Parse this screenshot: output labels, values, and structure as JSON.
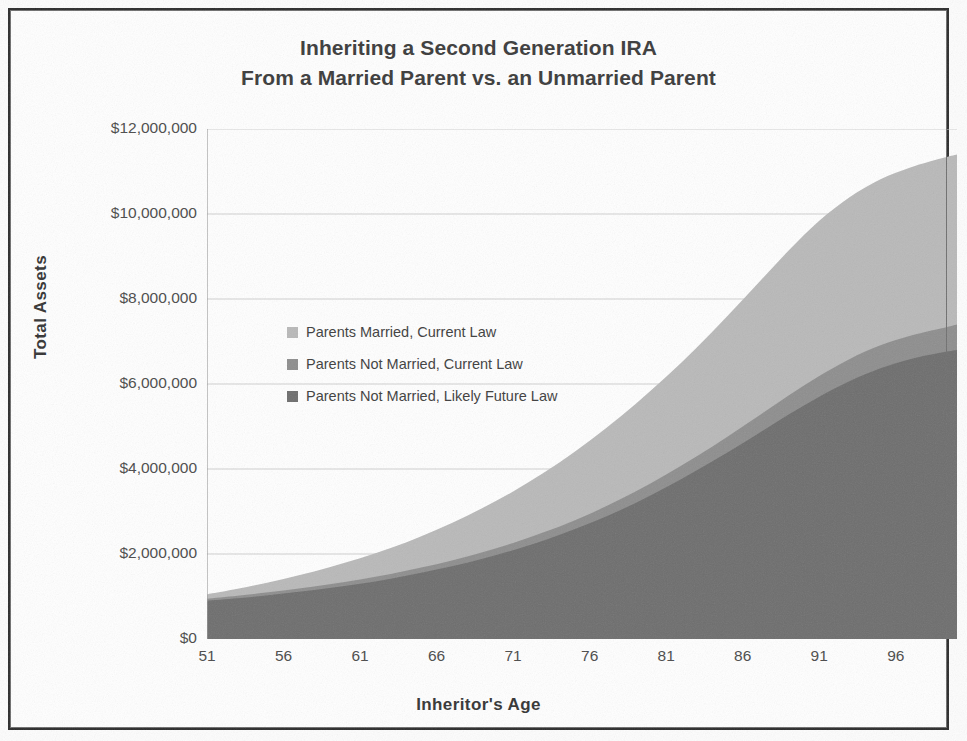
{
  "chart_data": {
    "type": "area",
    "stacked": false,
    "title": "Inheriting a Second Generation IRA",
    "subtitle": "From a Married Parent vs. an Unmarried Parent",
    "title_lines": [
      "Inheriting a Second Generation IRA",
      "From a Married Parent vs. an Unmarried Parent"
    ],
    "xlabel": "Inheritor's Age",
    "ylabel": "Total Assets",
    "xlim": [
      51,
      100
    ],
    "ylim": [
      0,
      12000000
    ],
    "ytick_step": 2000000,
    "xtick_step": 5,
    "xtick_minor_step": 1,
    "grid": "horizontal",
    "legend_position": "inside-left",
    "ytick_labels": [
      "$12,000,000",
      "$10,000,000",
      "$8,000,000",
      "$6,000,000",
      "$4,000,000",
      "$2,000,000",
      "$0"
    ],
    "ytick_values": [
      12000000,
      10000000,
      8000000,
      6000000,
      4000000,
      2000000,
      0
    ],
    "xtick_labels": [
      "51",
      "56",
      "61",
      "66",
      "71",
      "76",
      "81",
      "86",
      "91",
      "96"
    ],
    "xtick_values": [
      51,
      56,
      61,
      66,
      71,
      76,
      81,
      86,
      91,
      96
    ],
    "x": [
      51,
      53,
      55,
      57,
      59,
      61,
      63,
      65,
      67,
      69,
      71,
      73,
      75,
      77,
      79,
      81,
      83,
      85,
      87,
      89,
      91,
      93,
      95,
      97,
      99,
      100
    ],
    "series": [
      {
        "name": "Parents Married, Current Law",
        "color": "#b9b9b9",
        "values": [
          1050000,
          1180000,
          1330000,
          1500000,
          1690000,
          1900000,
          2140000,
          2420000,
          2730000,
          3080000,
          3470000,
          3910000,
          4400000,
          4940000,
          5530000,
          6170000,
          6860000,
          7600000,
          8370000,
          9140000,
          9840000,
          10400000,
          10820000,
          11100000,
          11310000,
          11400000
        ]
      },
      {
        "name": "Parents Not Married, Current Law",
        "color": "#8e8e8e",
        "values": [
          950000,
          1020000,
          1100000,
          1190000,
          1290000,
          1400000,
          1530000,
          1680000,
          1850000,
          2040000,
          2260000,
          2510000,
          2790000,
          3110000,
          3470000,
          3870000,
          4300000,
          4760000,
          5240000,
          5730000,
          6190000,
          6590000,
          6910000,
          7140000,
          7310000,
          7400000
        ]
      },
      {
        "name": "Parents Not Married, Likely Future Law",
        "color": "#6e6e6e",
        "values": [
          900000,
          960000,
          1030000,
          1110000,
          1200000,
          1300000,
          1420000,
          1560000,
          1710000,
          1890000,
          2090000,
          2320000,
          2580000,
          2870000,
          3200000,
          3570000,
          3970000,
          4390000,
          4830000,
          5280000,
          5700000,
          6070000,
          6370000,
          6590000,
          6740000,
          6800000
        ]
      }
    ],
    "legend": [
      {
        "label": "Parents Married, Current Law",
        "color": "#b9b9b9"
      },
      {
        "label": "Parents Not Married, Current Law",
        "color": "#8e8e8e"
      },
      {
        "label": "Parents Not Married, Likely Future Law",
        "color": "#6e6e6e"
      }
    ]
  },
  "colors": {
    "series_light": "#b9b9b9",
    "series_medium": "#8e8e8e",
    "series_dark": "#6e6e6e",
    "grid": "#cfcfcf",
    "axis": "#9a9a9a",
    "text": "#3a3a3a",
    "frame": "#2b2b2b"
  }
}
